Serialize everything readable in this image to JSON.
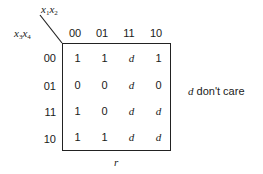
{
  "kmap": {
    "column_variables": {
      "base": "x",
      "first_index": "1",
      "second_index": "2"
    },
    "row_variables": {
      "base": "x",
      "first_index": "3",
      "second_index": "4"
    },
    "columns": [
      "00",
      "01",
      "11",
      "10"
    ],
    "rows": [
      "00",
      "01",
      "11",
      "10"
    ],
    "cells": [
      [
        "1",
        "1",
        "d",
        "1"
      ],
      [
        "0",
        "0",
        "d",
        "0"
      ],
      [
        "1",
        "0",
        "d",
        "d"
      ],
      [
        "1",
        "1",
        "d",
        "d"
      ]
    ],
    "function_label": "r",
    "legend": {
      "symbol": "d",
      "text": " don't care"
    }
  }
}
